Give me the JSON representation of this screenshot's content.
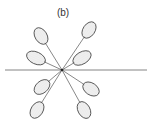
{
  "figure": {
    "label": "(b)",
    "center": [
      62,
      70
    ],
    "baseline": {
      "x1": 5,
      "x2": 147,
      "y": 70
    },
    "stroke_color": "#555555",
    "fill_dot_color": "#666666",
    "lobes": [
      {
        "name": "upper-left-far",
        "cx": 41,
        "cy": 36,
        "rx": 9,
        "ry": 6,
        "angle": -55
      },
      {
        "name": "upper-left-near",
        "cx": 36,
        "cy": 58,
        "rx": 10,
        "ry": 6,
        "angle": 25
      },
      {
        "name": "upper-right-far",
        "cx": 89,
        "cy": 30,
        "rx": 9,
        "ry": 6,
        "angle": -55
      },
      {
        "name": "upper-right-near",
        "cx": 82,
        "cy": 58,
        "rx": 10,
        "ry": 6,
        "angle": -25
      },
      {
        "name": "lower-left-near",
        "cx": 42,
        "cy": 87,
        "rx": 9,
        "ry": 6,
        "angle": -25
      },
      {
        "name": "lower-left-far",
        "cx": 37,
        "cy": 110,
        "rx": 9,
        "ry": 6,
        "angle": -60
      },
      {
        "name": "lower-right-near",
        "cx": 91,
        "cy": 89,
        "rx": 9,
        "ry": 6,
        "angle": 30
      },
      {
        "name": "lower-right-far",
        "cx": 84,
        "cy": 110,
        "rx": 9,
        "ry": 6,
        "angle": 60
      }
    ]
  }
}
